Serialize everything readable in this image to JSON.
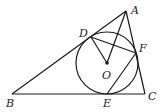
{
  "diagram": {
    "type": "geometry",
    "points": {
      "A": {
        "label": "A",
        "x": 126,
        "y": 11
      },
      "B": {
        "label": "B",
        "x": 12,
        "y": 94
      },
      "C": {
        "label": "C",
        "x": 145,
        "y": 94
      },
      "D": {
        "label": "D",
        "x": 91,
        "y": 37
      },
      "E": {
        "label": "E",
        "x": 107,
        "y": 94
      },
      "F": {
        "label": "F",
        "x": 136,
        "y": 53
      },
      "O": {
        "label": "O",
        "x": 107,
        "y": 63
      }
    },
    "circle": {
      "center": "O",
      "radius": 31
    },
    "segments": [
      "AB",
      "BC",
      "CA",
      "AO",
      "DO",
      "DF",
      "EF"
    ],
    "colors": {
      "stroke": "#1a1a1a",
      "background": "#ffffff"
    }
  }
}
